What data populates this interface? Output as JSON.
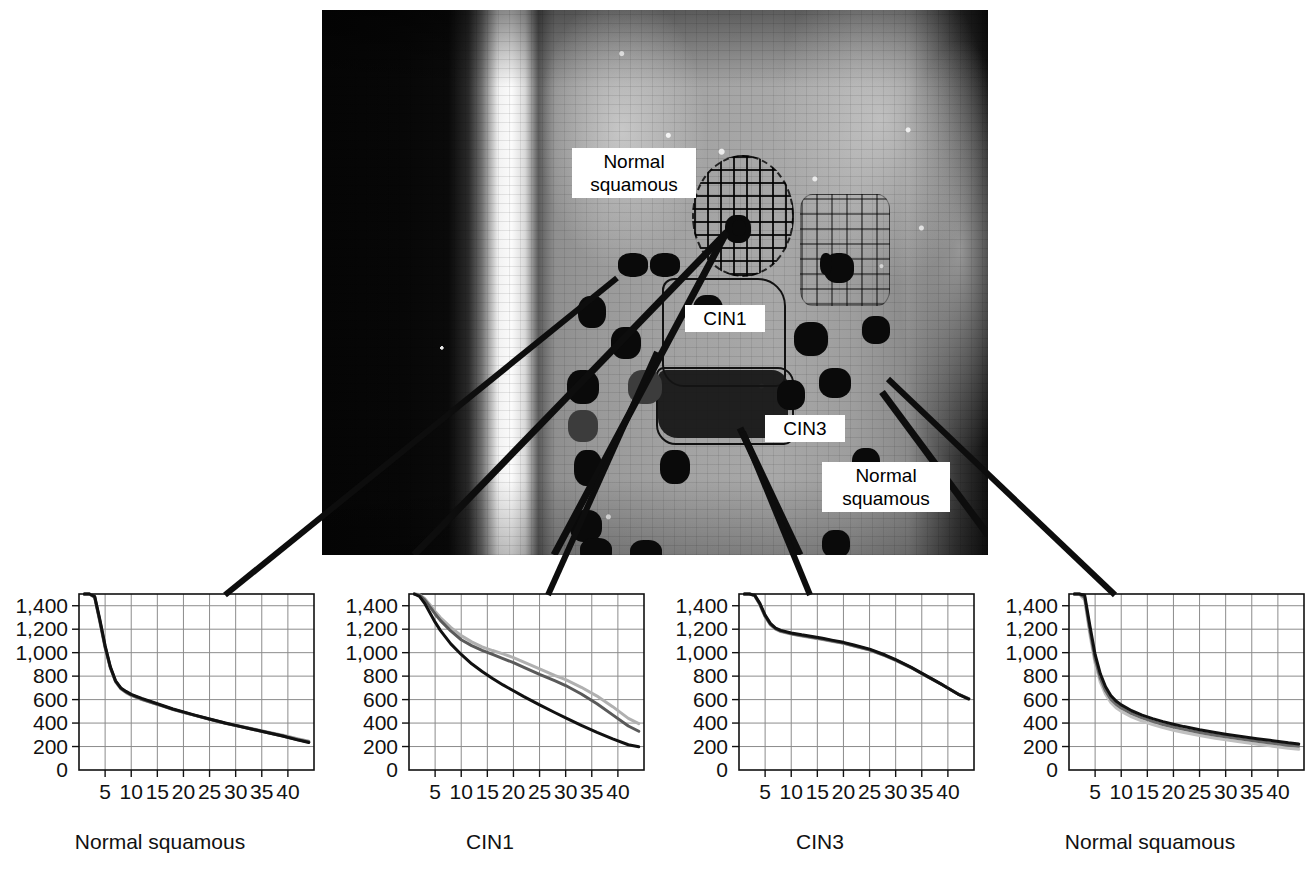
{
  "figure": {
    "type": "multi-panel-figure"
  },
  "tissue_image": {
    "name": "cervical-tissue-section",
    "labels": [
      {
        "id": "normal-squamous-top",
        "text": "Normal\nsquamous",
        "x": 250,
        "y": 138,
        "w": 112,
        "h": 52
      },
      {
        "id": "cin1",
        "text": "CIN1",
        "x": 363,
        "y": 295,
        "w": 68,
        "h": 28
      },
      {
        "id": "cin3",
        "text": "CIN3",
        "x": 443,
        "y": 405,
        "w": 68,
        "h": 28
      },
      {
        "id": "normal-squamous-bottom",
        "text": "Normal\nsquamous",
        "x": 500,
        "y": 452,
        "w": 116,
        "h": 54
      }
    ]
  },
  "chart_data": [
    {
      "type": "line",
      "title": "",
      "xlabel": "Normal squamous",
      "ylabel": "",
      "xlim": [
        0,
        45
      ],
      "ylim": [
        0,
        1500
      ],
      "xticks": [
        5,
        10,
        15,
        20,
        25,
        30,
        35,
        40
      ],
      "yticks": [
        0,
        200,
        400,
        600,
        800,
        1000,
        1200,
        1400
      ],
      "ytick_labels": [
        "0",
        "200",
        "400",
        "600",
        "800",
        "1,000",
        "1,200",
        "1,400"
      ],
      "grid": true,
      "legend": "none",
      "x": [
        1,
        2,
        3,
        4,
        5,
        6,
        7,
        8,
        9,
        10,
        12,
        14,
        16,
        18,
        20,
        22,
        25,
        28,
        30,
        33,
        36,
        39,
        42,
        44
      ],
      "series": [
        {
          "name": "spectrum-1",
          "color": "#111111",
          "values": [
            1500,
            1500,
            1480,
            1280,
            1060,
            880,
            760,
            700,
            670,
            645,
            610,
            580,
            550,
            520,
            495,
            470,
            435,
            400,
            380,
            350,
            320,
            290,
            255,
            235
          ]
        },
        {
          "name": "spectrum-2",
          "color": "#555555",
          "values": [
            1500,
            1500,
            1475,
            1270,
            1050,
            875,
            757,
            697,
            665,
            640,
            605,
            575,
            546,
            517,
            492,
            468,
            433,
            398,
            378,
            349,
            319,
            290,
            257,
            238
          ]
        },
        {
          "name": "spectrum-3",
          "color": "#9a9a9a",
          "values": [
            1500,
            1500,
            1470,
            1260,
            1040,
            870,
            752,
            692,
            660,
            636,
            601,
            572,
            544,
            516,
            491,
            468,
            434,
            400,
            381,
            353,
            324,
            296,
            264,
            246
          ]
        }
      ]
    },
    {
      "type": "line",
      "title": "",
      "xlabel": "CIN1",
      "ylabel": "",
      "xlim": [
        0,
        45
      ],
      "ylim": [
        0,
        1500
      ],
      "xticks": [
        5,
        10,
        15,
        20,
        25,
        30,
        35,
        40
      ],
      "yticks": [
        0,
        200,
        400,
        600,
        800,
        1000,
        1200,
        1400
      ],
      "ytick_labels": [
        "0",
        "200",
        "400",
        "600",
        "800",
        "1,000",
        "1,200",
        "1,400"
      ],
      "grid": true,
      "legend": "none",
      "x": [
        1,
        2,
        3,
        4,
        5,
        6,
        8,
        10,
        12,
        14,
        16,
        18,
        20,
        22,
        25,
        28,
        30,
        33,
        36,
        39,
        42,
        44
      ],
      "series": [
        {
          "name": "spectrum-1",
          "color": "#111111",
          "values": [
            1500,
            1480,
            1420,
            1340,
            1260,
            1190,
            1075,
            985,
            905,
            840,
            780,
            725,
            675,
            625,
            555,
            488,
            445,
            380,
            320,
            265,
            215,
            198
          ]
        },
        {
          "name": "spectrum-2",
          "color": "#5a5a5a",
          "values": [
            1500,
            1490,
            1450,
            1390,
            1330,
            1275,
            1185,
            1110,
            1060,
            1020,
            985,
            950,
            915,
            875,
            815,
            760,
            720,
            648,
            565,
            470,
            375,
            330
          ]
        },
        {
          "name": "spectrum-3",
          "color": "#b0b0b0",
          "values": [
            1500,
            1495,
            1462,
            1408,
            1352,
            1300,
            1215,
            1145,
            1092,
            1050,
            1018,
            990,
            958,
            920,
            862,
            805,
            770,
            705,
            630,
            540,
            440,
            395
          ]
        }
      ]
    },
    {
      "type": "line",
      "title": "",
      "xlabel": "CIN3",
      "ylabel": "",
      "xlim": [
        0,
        45
      ],
      "ylim": [
        0,
        1500
      ],
      "xticks": [
        5,
        10,
        15,
        20,
        25,
        30,
        35,
        40
      ],
      "yticks": [
        0,
        200,
        400,
        600,
        800,
        1000,
        1200,
        1400
      ],
      "ytick_labels": [
        "0",
        "200",
        "400",
        "600",
        "800",
        "1,000",
        "1,200",
        "1,400"
      ],
      "grid": true,
      "legend": "none",
      "x": [
        1,
        2,
        3,
        4,
        5,
        6,
        7,
        8,
        10,
        12,
        14,
        16,
        18,
        20,
        22,
        25,
        28,
        30,
        33,
        36,
        39,
        42,
        44
      ],
      "series": [
        {
          "name": "spectrum-1",
          "color": "#111111",
          "values": [
            1500,
            1500,
            1490,
            1420,
            1320,
            1250,
            1210,
            1190,
            1168,
            1152,
            1138,
            1122,
            1105,
            1088,
            1065,
            1030,
            980,
            940,
            875,
            800,
            725,
            645,
            605
          ]
        },
        {
          "name": "spectrum-2",
          "color": "#5f5f5f",
          "values": [
            1500,
            1500,
            1488,
            1412,
            1312,
            1243,
            1204,
            1184,
            1162,
            1146,
            1132,
            1116,
            1099,
            1082,
            1059,
            1025,
            975,
            936,
            872,
            798,
            724,
            646,
            607
          ]
        },
        {
          "name": "spectrum-3",
          "color": "#a5a5a5",
          "values": [
            1500,
            1500,
            1486,
            1408,
            1306,
            1238,
            1200,
            1180,
            1158,
            1142,
            1128,
            1112,
            1096,
            1079,
            1056,
            1022,
            973,
            934,
            871,
            797,
            724,
            647,
            609
          ]
        }
      ]
    },
    {
      "type": "line",
      "title": "",
      "xlabel": "Normal squamous",
      "ylabel": "",
      "xlim": [
        0,
        45
      ],
      "ylim": [
        0,
        1500
      ],
      "xticks": [
        5,
        10,
        15,
        20,
        25,
        30,
        35,
        40
      ],
      "yticks": [
        0,
        200,
        400,
        600,
        800,
        1000,
        1200,
        1400
      ],
      "ytick_labels": [
        "0",
        "200",
        "400",
        "600",
        "800",
        "1,000",
        "1,200",
        "1,400"
      ],
      "grid": true,
      "legend": "none",
      "x": [
        1,
        2,
        3,
        4,
        5,
        6,
        7,
        8,
        9,
        10,
        12,
        14,
        16,
        18,
        20,
        22,
        25,
        28,
        30,
        33,
        36,
        39,
        42,
        44
      ],
      "series": [
        {
          "name": "spectrum-1",
          "color": "#111111",
          "values": [
            1500,
            1500,
            1490,
            1230,
            985,
            820,
            710,
            635,
            588,
            555,
            505,
            468,
            438,
            412,
            390,
            370,
            343,
            320,
            305,
            285,
            267,
            250,
            232,
            222
          ]
        },
        {
          "name": "spectrum-2",
          "color": "#6a6a6a",
          "values": [
            1500,
            1500,
            1470,
            1190,
            945,
            782,
            675,
            604,
            560,
            528,
            480,
            444,
            414,
            388,
            366,
            346,
            320,
            297,
            283,
            263,
            245,
            228,
            211,
            202
          ]
        },
        {
          "name": "spectrum-3",
          "color": "#c0c0c0",
          "values": [
            1500,
            1498,
            1450,
            1155,
            908,
            748,
            645,
            575,
            531,
            500,
            452,
            416,
            387,
            361,
            339,
            320,
            294,
            271,
            257,
            238,
            220,
            203,
            186,
            177
          ]
        }
      ]
    }
  ],
  "charts_layout": [
    {
      "id": "chart-normal-squamous-left",
      "left": 0,
      "top": 582
    },
    {
      "id": "chart-cin1",
      "left": 330,
      "top": 582
    },
    {
      "id": "chart-cin3",
      "left": 660,
      "top": 582
    },
    {
      "id": "chart-normal-squamous-right",
      "left": 990,
      "top": 582
    }
  ],
  "leader_lines": [
    {
      "id": "leader-normal-squamous-left",
      "x1": 617,
      "y1": 278,
      "x2": 225,
      "y2": 595
    },
    {
      "id": "leader-cin1",
      "x1": 657,
      "y1": 352,
      "x2": 548,
      "y2": 595
    },
    {
      "id": "leader-cin3",
      "x1": 743,
      "y1": 432,
      "x2": 810,
      "y2": 595
    },
    {
      "id": "leader-normal-squamous-right",
      "x1": 888,
      "y1": 379,
      "x2": 1115,
      "y2": 595
    }
  ],
  "colors": {
    "background": "#ffffff",
    "axis": "#111111",
    "grid": "#8c8c8c",
    "text": "#111111"
  }
}
